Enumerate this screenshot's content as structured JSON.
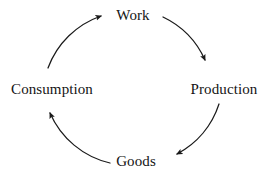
{
  "diagram": {
    "type": "cycle",
    "direction": "clockwise",
    "background_color": "#ffffff",
    "stroke_color": "#1a1a1a",
    "text_color": "#141414",
    "nodes": [
      {
        "id": "work",
        "label": "Work",
        "position": "top"
      },
      {
        "id": "production",
        "label": "Production",
        "position": "right"
      },
      {
        "id": "goods",
        "label": "Goods",
        "position": "bottom"
      },
      {
        "id": "consumption",
        "label": "Consumption",
        "position": "left"
      }
    ],
    "edges": [
      {
        "id": "work-to-production",
        "from": "Work",
        "to": "Production",
        "arrowhead": "at-target"
      },
      {
        "id": "production-to-goods",
        "from": "Production",
        "to": "Goods",
        "arrowhead": "at-target"
      },
      {
        "id": "goods-to-consumption",
        "from": "Goods",
        "to": "Consumption",
        "arrowhead": "at-target"
      },
      {
        "id": "consumption-to-work",
        "from": "Consumption",
        "to": "Work",
        "arrowhead": "at-target"
      }
    ]
  }
}
